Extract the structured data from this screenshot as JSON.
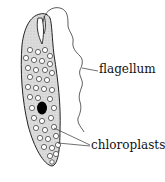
{
  "diagram": {
    "labels": {
      "flagellum": "flagellum",
      "chloroplasts": "chloroplasts"
    },
    "caption_partial": "E...  ...f...",
    "colors": {
      "body_fill": "#d9d9d9",
      "outline": "#222222",
      "nucleus": "#000000",
      "chloroplast_fill": "#ffffff"
    }
  }
}
